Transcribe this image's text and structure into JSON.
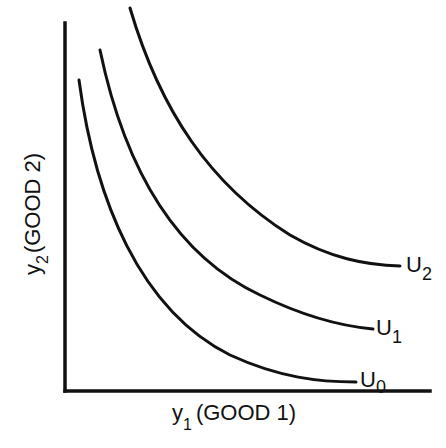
{
  "diagram": {
    "type": "indifference-curves",
    "colors": {
      "line": "#111111",
      "background": "#ffffff"
    },
    "axes": {
      "x": {
        "symbol": "y",
        "subscript": "1",
        "label": "(GOOD 1)"
      },
      "y": {
        "symbol": "y",
        "subscript": "2",
        "label": "(GOOD 2)"
      }
    },
    "curves": [
      {
        "name": "U",
        "subscript": "0",
        "label": "U0"
      },
      {
        "name": "U",
        "subscript": "1",
        "label": "U1"
      },
      {
        "name": "U",
        "subscript": "2",
        "label": "U2"
      }
    ]
  }
}
